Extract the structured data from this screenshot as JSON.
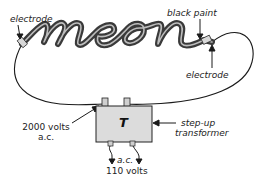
{
  "diagram": {
    "tube_text": "neon",
    "labels": {
      "electrode_left": "electrode",
      "black_paint": "black paint",
      "electrode_right": "electrode",
      "high_voltage_line1": "2000 volts",
      "high_voltage_line2": "a.c.",
      "transformer_line1": "step-up",
      "transformer_line2": "transformer",
      "transformer_symbol": "T",
      "input_line1": "a.c.",
      "input_line2": "110 volts"
    },
    "colors": {
      "tube": "#3a3a3a",
      "tube_highlight": "#bdbdbd",
      "wire": "#1a1a1a",
      "transformer_fill": "#dcdcdc",
      "text": "#222222"
    }
  }
}
